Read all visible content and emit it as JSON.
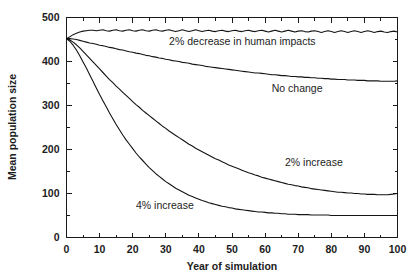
{
  "chart_data": {
    "type": "line",
    "title": "",
    "subtitle": "",
    "xlabel": "Year of simulation",
    "ylabel": "Mean population size",
    "xlim": [
      0,
      100
    ],
    "ylim": [
      0,
      500
    ],
    "xticks": [
      0,
      10,
      20,
      30,
      40,
      50,
      60,
      70,
      80,
      90,
      100
    ],
    "yticks": [
      0,
      100,
      200,
      300,
      400,
      500
    ],
    "xtick_labels": [
      "0",
      "10",
      "20",
      "30",
      "40",
      "50",
      "60",
      "70",
      "80",
      "90",
      "100"
    ],
    "ytick_labels": [
      "0",
      "100",
      "200",
      "300",
      "400",
      "500"
    ],
    "x_minor_step": 5,
    "y_minor_step": 50,
    "grid": false,
    "legend_position": "inline-annotations",
    "frame": "box",
    "line_color": "#141414",
    "annotations": [
      {
        "text": "2% decrease in human impacts",
        "x": 31,
        "y": 438
      },
      {
        "text": "No change",
        "x": 62,
        "y": 330
      },
      {
        "text": "2% increase",
        "x": 66,
        "y": 163
      },
      {
        "text": "4% increase",
        "x": 21,
        "y": 65
      }
    ],
    "x": [
      0,
      1,
      2,
      3,
      4,
      5,
      6,
      7,
      8,
      9,
      10,
      11,
      12,
      13,
      14,
      15,
      16,
      17,
      18,
      19,
      20,
      21,
      22,
      23,
      24,
      25,
      26,
      27,
      28,
      29,
      30,
      31,
      32,
      33,
      34,
      35,
      36,
      37,
      38,
      39,
      40,
      41,
      42,
      43,
      44,
      45,
      46,
      47,
      48,
      49,
      50,
      51,
      52,
      53,
      54,
      55,
      56,
      57,
      58,
      59,
      60,
      61,
      62,
      63,
      64,
      65,
      66,
      67,
      68,
      69,
      70,
      71,
      72,
      73,
      74,
      75,
      76,
      77,
      78,
      79,
      80,
      81,
      82,
      83,
      84,
      85,
      86,
      87,
      88,
      89,
      90,
      91,
      92,
      93,
      94,
      95,
      96,
      97,
      98,
      99,
      100
    ],
    "series": [
      {
        "name": "2% decrease in human impacts",
        "label": "2% decrease in human impacts",
        "values": [
          452,
          456,
          461,
          464,
          467,
          469,
          470,
          471,
          471,
          470,
          471,
          472,
          470,
          469,
          471,
          472,
          470,
          469,
          471,
          472,
          470,
          469,
          471,
          472,
          470,
          469,
          471,
          472,
          470,
          469,
          471,
          472,
          470,
          468,
          470,
          472,
          470,
          468,
          470,
          472,
          470,
          468,
          470,
          471,
          469,
          468,
          470,
          471,
          469,
          468,
          470,
          471,
          469,
          468,
          470,
          471,
          469,
          468,
          470,
          471,
          469,
          467,
          469,
          471,
          469,
          467,
          469,
          471,
          469,
          467,
          469,
          470,
          468,
          467,
          469,
          470,
          468,
          466,
          468,
          470,
          468,
          466,
          468,
          470,
          468,
          466,
          468,
          470,
          468,
          466,
          468,
          470,
          468,
          466,
          468,
          469,
          467,
          466,
          468,
          469,
          467
        ]
      },
      {
        "name": "No change",
        "label": "No change",
        "values": [
          452,
          452,
          451,
          450,
          448,
          446,
          444,
          442,
          441,
          439,
          437,
          436,
          434,
          432,
          431,
          429,
          427,
          426,
          424,
          422,
          421,
          419,
          418,
          416,
          414,
          413,
          411,
          410,
          408,
          407,
          405,
          404,
          402,
          401,
          400,
          398,
          397,
          396,
          394,
          393,
          392,
          391,
          389,
          388,
          387,
          386,
          385,
          384,
          383,
          382,
          381,
          380,
          379,
          378,
          377,
          376,
          375,
          374,
          374,
          373,
          372,
          371,
          370,
          370,
          369,
          368,
          368,
          367,
          366,
          366,
          365,
          365,
          364,
          364,
          363,
          363,
          362,
          362,
          361,
          361,
          360,
          360,
          359,
          359,
          359,
          358,
          358,
          358,
          357,
          357,
          357,
          356,
          356,
          356,
          356,
          355,
          355,
          355,
          355,
          355,
          356
        ]
      },
      {
        "name": "2% increase",
        "label": "2% increase",
        "values": [
          452,
          449,
          444,
          438,
          431,
          423,
          415,
          407,
          399,
          391,
          383,
          375,
          367,
          359,
          352,
          344,
          337,
          330,
          323,
          316,
          309,
          302,
          296,
          289,
          283,
          277,
          271,
          265,
          259,
          253,
          248,
          242,
          237,
          232,
          227,
          222,
          217,
          212,
          208,
          203,
          199,
          195,
          191,
          187,
          183,
          179,
          176,
          172,
          169,
          165,
          162,
          159,
          156,
          153,
          150,
          147,
          145,
          142,
          140,
          137,
          135,
          133,
          131,
          129,
          127,
          125,
          123,
          121,
          120,
          118,
          117,
          115,
          114,
          113,
          111,
          110,
          109,
          108,
          107,
          106,
          105,
          104,
          103,
          103,
          102,
          101,
          101,
          100,
          100,
          99,
          99,
          98,
          98,
          98,
          97,
          97,
          97,
          97,
          98,
          99,
          100
        ]
      },
      {
        "name": "4% increase",
        "label": "4% increase",
        "values": [
          452,
          446,
          437,
          426,
          413,
          399,
          385,
          370,
          355,
          340,
          325,
          311,
          297,
          283,
          270,
          257,
          245,
          233,
          222,
          212,
          202,
          192,
          183,
          175,
          167,
          159,
          152,
          145,
          139,
          133,
          127,
          122,
          117,
          112,
          108,
          104,
          100,
          96,
          93,
          90,
          87,
          84,
          82,
          79,
          77,
          75,
          73,
          71,
          70,
          68,
          67,
          65,
          64,
          63,
          62,
          61,
          60,
          59,
          58,
          58,
          57,
          56,
          56,
          55,
          55,
          54,
          54,
          53,
          53,
          53,
          52,
          52,
          52,
          52,
          51,
          51,
          51,
          51,
          51,
          51,
          50,
          50,
          50,
          50,
          50,
          50,
          50,
          50,
          50,
          50,
          50,
          50,
          50,
          50,
          50,
          50,
          50,
          50,
          50,
          50,
          50
        ]
      }
    ]
  }
}
